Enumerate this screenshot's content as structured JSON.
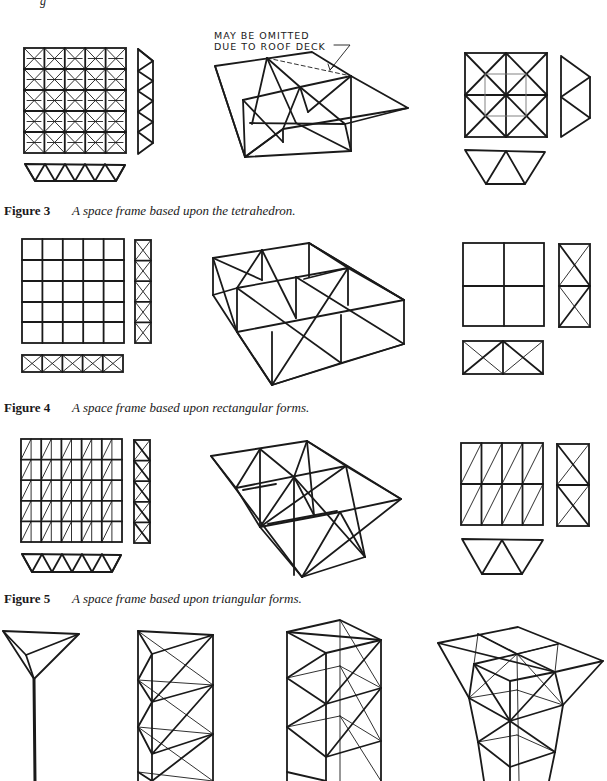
{
  "page": {
    "top_fragment": "g"
  },
  "figures": [
    {
      "id": "figure-3",
      "label": "Figure 3",
      "caption": "A space frame based upon the tetrahedron.",
      "annotation": {
        "line1": "MAY BE OMITTED",
        "line2": "DUE TO ROOF DECK"
      },
      "views": [
        "plan-5x5-grid-with-diagonals",
        "side-elevation-triangles",
        "bottom-elevation-triangles",
        "isometric",
        "detail-plan-2x2",
        "detail-side",
        "detail-bottom"
      ]
    },
    {
      "id": "figure-4",
      "label": "Figure 4",
      "caption": "A space frame based upon rectangular forms.",
      "views": [
        "plan-5x5-grid",
        "side-elevation-x-braced",
        "bottom-elevation-x-braced",
        "isometric",
        "detail-plan-2x2",
        "detail-side",
        "detail-bottom"
      ]
    },
    {
      "id": "figure-5",
      "label": "Figure 5",
      "caption": "A space frame based upon triangular forms.",
      "views": [
        "plan-grid-single-diagonals",
        "side-elevation-x-braced",
        "bottom-elevation-triangles",
        "isometric",
        "detail-plan",
        "detail-side",
        "detail-bottom"
      ]
    },
    {
      "id": "figure-6-partial",
      "label": "",
      "caption": "",
      "views": [
        "single-column-tripod",
        "triangular-tower",
        "square-tower",
        "tapered-tower"
      ]
    }
  ]
}
